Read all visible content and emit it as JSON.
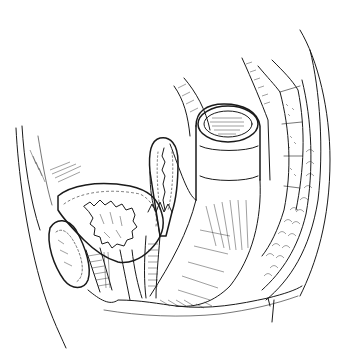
{
  "image": {
    "kind": "anatomical line illustration",
    "style": "black ink line drawing on white, hatched shading",
    "view": "sagittal section",
    "background_color": "#ffffff",
    "ink_color": "#1a1a1a",
    "text_labels": []
  },
  "structures": [
    {
      "id": "abdominal-wall",
      "name": "anterior abdominal wall"
    },
    {
      "id": "bladder",
      "name": "urinary bladder"
    },
    {
      "id": "pubic-symphysis",
      "name": "pubic symphysis"
    },
    {
      "id": "urethra",
      "name": "urethra"
    },
    {
      "id": "uterus",
      "name": "uterus"
    },
    {
      "id": "vagina",
      "name": "vagina"
    },
    {
      "id": "rectum",
      "name": "rectum / sigmoid colon"
    },
    {
      "id": "sacrum",
      "name": "sacrum and coccyx"
    },
    {
      "id": "presacral-fat",
      "name": "pararectal fatty tissue"
    },
    {
      "id": "perineum",
      "name": "perineal floor"
    },
    {
      "id": "buttock-contour",
      "name": "posterior body contour"
    }
  ]
}
